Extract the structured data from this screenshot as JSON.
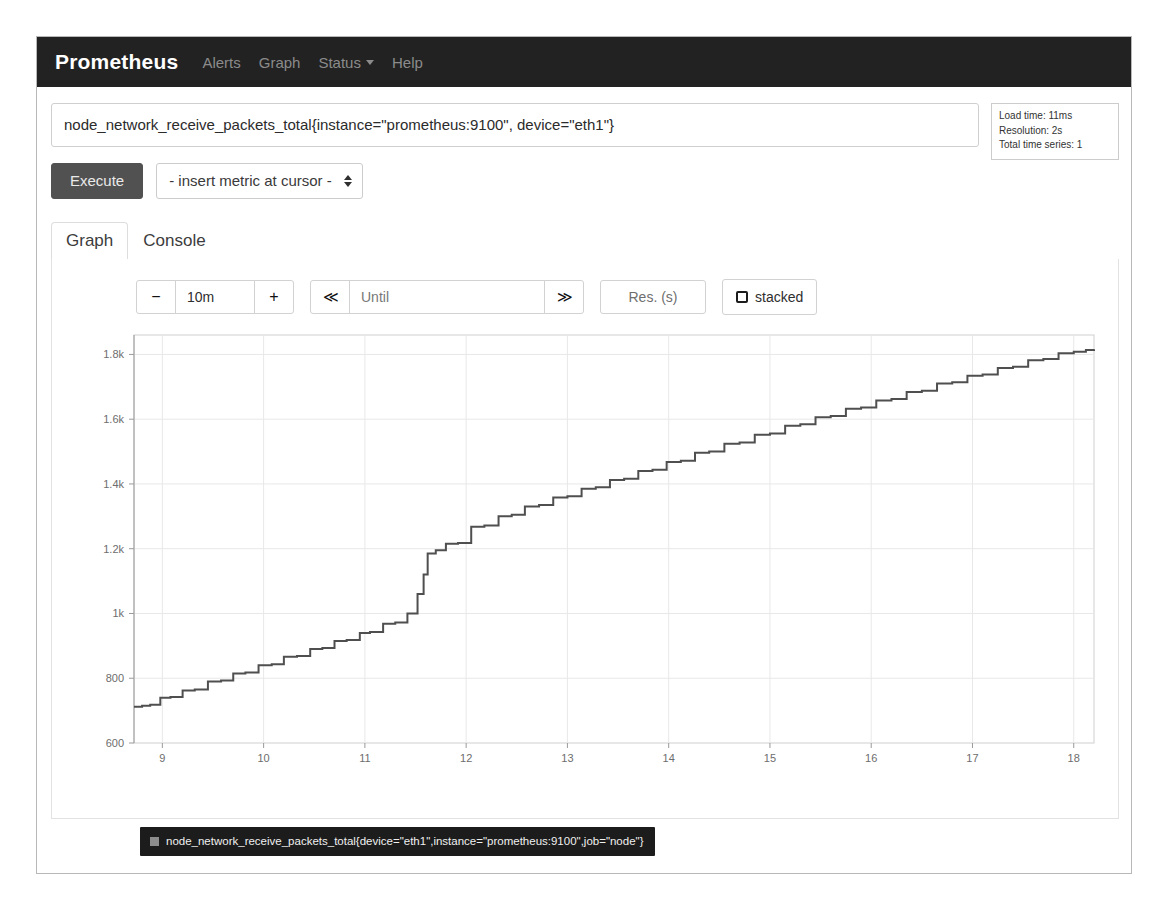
{
  "navbar": {
    "brand": "Prometheus",
    "links": [
      {
        "label": "Alerts"
      },
      {
        "label": "Graph"
      },
      {
        "label": "Status",
        "caret": true
      },
      {
        "label": "Help"
      }
    ]
  },
  "query": {
    "expression": "node_network_receive_packets_total{instance=\"prometheus:9100\", device=\"eth1\"}",
    "placeholder": "Expression (press Shift+Enter for newlines)"
  },
  "stats": {
    "load_time": "Load time: 11ms",
    "resolution": "Resolution: 2s",
    "total_time_series": "Total time series: 1"
  },
  "actions": {
    "execute_label": "Execute",
    "metric_select_value": "- insert metric at cursor -",
    "metric_select_options": [
      "- insert metric at cursor -"
    ]
  },
  "tabs": [
    {
      "label": "Graph",
      "active": true
    },
    {
      "label": "Console",
      "active": false
    }
  ],
  "controls": {
    "decrease_label": "−",
    "range_value": "10m",
    "increase_label": "+",
    "back_label": "≪",
    "until_value": "",
    "until_placeholder": "Until",
    "forward_label": "≫",
    "resolution_placeholder": "Res. (s)",
    "resolution_value": "",
    "stacked_label": "stacked",
    "stacked_checked": false
  },
  "legend": {
    "series_label": "node_network_receive_packets_total{device=\"eth1\",instance=\"prometheus:9100\",job=\"node\"}",
    "swatch_color": "#8d8d8d"
  },
  "colors": {
    "navbar_bg": "#222222",
    "execute_bg": "#515151",
    "line_color": "#4f4f4f",
    "grid_color": "#e8e8e8",
    "legend_bg": "#1c1c1c"
  },
  "chart_data": {
    "type": "line",
    "title": "",
    "xlabel": "",
    "ylabel": "",
    "xtick_labels": [
      "9",
      "10",
      "11",
      "12",
      "13",
      "14",
      "15",
      "16",
      "17",
      "18"
    ],
    "ytick_labels": [
      "600",
      "800",
      "1k",
      "1.2k",
      "1.4k",
      "1.6k",
      "1.8k"
    ],
    "ytick_values": [
      600,
      800,
      1000,
      1200,
      1400,
      1600,
      1800
    ],
    "xlim": [
      8.72,
      18.2
    ],
    "ylim": [
      600,
      1860
    ],
    "grid": true,
    "legend_position": "bottom-left",
    "step_interpolation": true,
    "series": [
      {
        "name": "node_network_receive_packets_total{device=\"eth1\",instance=\"prometheus:9100\",job=\"node\"}",
        "color": "#4f4f4f",
        "x": [
          8.72,
          8.8,
          8.88,
          8.98,
          9.08,
          9.2,
          9.32,
          9.45,
          9.58,
          9.7,
          9.82,
          9.95,
          10.08,
          10.2,
          10.33,
          10.46,
          10.58,
          10.7,
          10.82,
          10.95,
          11.05,
          11.18,
          11.3,
          11.42,
          11.52,
          11.58,
          11.62,
          11.7,
          11.8,
          11.92,
          12.05,
          12.18,
          12.32,
          12.45,
          12.58,
          12.72,
          12.86,
          13.0,
          13.14,
          13.28,
          13.42,
          13.56,
          13.7,
          13.84,
          13.98,
          14.12,
          14.26,
          14.4,
          14.55,
          14.7,
          14.85,
          15.0,
          15.15,
          15.3,
          15.45,
          15.6,
          15.75,
          15.9,
          16.05,
          16.2,
          16.35,
          16.5,
          16.65,
          16.8,
          16.95,
          17.1,
          17.25,
          17.4,
          17.55,
          17.7,
          17.85,
          18.0,
          18.12,
          18.2
        ],
        "y": [
          712,
          715,
          718,
          740,
          742,
          762,
          765,
          790,
          793,
          815,
          818,
          840,
          843,
          866,
          869,
          890,
          893,
          915,
          918,
          940,
          943,
          968,
          972,
          1000,
          1060,
          1120,
          1185,
          1195,
          1215,
          1218,
          1268,
          1272,
          1300,
          1305,
          1330,
          1335,
          1358,
          1362,
          1385,
          1390,
          1412,
          1416,
          1440,
          1444,
          1468,
          1472,
          1496,
          1500,
          1524,
          1528,
          1552,
          1556,
          1580,
          1584,
          1606,
          1610,
          1632,
          1636,
          1658,
          1662,
          1684,
          1688,
          1710,
          1714,
          1734,
          1738,
          1758,
          1762,
          1782,
          1786,
          1804,
          1808,
          1814,
          1816
        ]
      }
    ]
  }
}
